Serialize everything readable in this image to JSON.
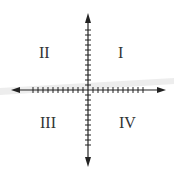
{
  "diagram": {
    "quadrants": [
      {
        "id": "I",
        "label": "I"
      },
      {
        "id": "II",
        "label": "II"
      },
      {
        "id": "III",
        "label": "III"
      },
      {
        "id": "IV",
        "label": "IV"
      }
    ],
    "axes": {
      "x": {
        "ticks_each_side": 11,
        "arrows": "both"
      },
      "y": {
        "ticks_each_side": 11,
        "arrows": "both"
      }
    },
    "colors": {
      "axis": "#222222",
      "label": "#333333",
      "background": "#ffffff"
    }
  }
}
